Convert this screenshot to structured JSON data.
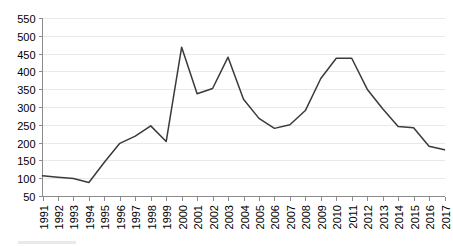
{
  "chart_data": {
    "type": "line",
    "title": "",
    "subtitle": "",
    "xlabel": "",
    "ylabel": "",
    "x": [
      1991,
      1992,
      1993,
      1994,
      1995,
      1996,
      1997,
      1998,
      1999,
      2000,
      2001,
      2002,
      2003,
      2004,
      2005,
      2006,
      2007,
      2008,
      2009,
      2010,
      2011,
      2012,
      2013,
      2014,
      2015,
      2016,
      2017
    ],
    "categories": [
      "1991",
      "1992",
      "1993",
      "1994",
      "1995",
      "1996",
      "1997",
      "1998",
      "1999",
      "2000",
      "2001",
      "2002",
      "2003",
      "2004",
      "2005",
      "2006",
      "2007",
      "2008",
      "2009",
      "2010",
      "2011",
      "2012",
      "2013",
      "2014",
      "2015",
      "2016",
      "2017"
    ],
    "values": [
      107,
      103,
      99,
      88,
      145,
      198,
      218,
      247,
      203,
      468,
      337,
      352,
      440,
      322,
      268,
      240,
      250,
      290,
      380,
      437,
      437,
      350,
      295,
      245,
      242,
      190,
      180
    ],
    "series": [
      {
        "name": "",
        "color": "#3a3a3a",
        "values": [
          107,
          103,
          99,
          88,
          145,
          198,
          218,
          247,
          203,
          468,
          337,
          352,
          440,
          322,
          268,
          240,
          250,
          290,
          380,
          437,
          437,
          350,
          295,
          245,
          242,
          190,
          180
        ]
      }
    ],
    "ylim": [
      50,
      550
    ],
    "xlim": [
      1991,
      2017
    ],
    "ytick_labels": [
      "550",
      "500",
      "450",
      "400",
      "350",
      "300",
      "250",
      "200",
      "150",
      "100",
      "50"
    ],
    "ytick_values": [
      550,
      500,
      450,
      400,
      350,
      300,
      250,
      200,
      150,
      100,
      50
    ],
    "xtick_labels": [
      "1991",
      "1992",
      "1993",
      "1994",
      "1995",
      "1996",
      "1997",
      "1998",
      "1999",
      "2000",
      "2001",
      "2002",
      "2003",
      "2004",
      "2005",
      "2006",
      "2007",
      "2008",
      "2009",
      "2010",
      "2011",
      "2012",
      "2013",
      "2014",
      "2015",
      "2016",
      "2017"
    ],
    "grid": true,
    "grid_axis": "y",
    "legend": false,
    "legend_position": "none",
    "xtick_label_rotation": 90,
    "line_color": "#3a3a3a",
    "gridline_color": "#e9e9e9",
    "axis_color": "#8b8b8b",
    "background_color": "#ffffff",
    "markers": false
  }
}
